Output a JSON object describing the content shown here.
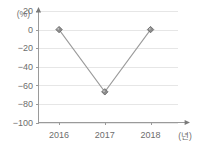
{
  "chart_data": {
    "type": "line",
    "title": "",
    "subtitle": "",
    "xlabel": "(년)",
    "ylabel": "(%)",
    "categories": [
      "2016",
      "2017",
      "2018"
    ],
    "x": [
      2016,
      2017,
      2018
    ],
    "values": [
      0,
      -67,
      0
    ],
    "series": [
      {
        "name": "",
        "values": [
          0,
          -67,
          0
        ]
      }
    ],
    "ylim": [
      -100,
      20
    ],
    "xlim": [
      2015.55,
      2018.6
    ],
    "y_ticks": [
      20,
      0,
      -20,
      -40,
      -60,
      -80,
      -100
    ],
    "y_tick_labels": [
      "20",
      "0",
      "−20",
      "−40",
      "−60",
      "−80",
      "−100"
    ],
    "x_ticks": [
      2016,
      2017,
      2018
    ],
    "x_tick_labels": [
      "2016",
      "2017",
      "2018"
    ],
    "grid": true,
    "grid_axis": "y",
    "legend": false,
    "legend_position": "none",
    "marker": "diamond",
    "annotations": []
  },
  "axes": {
    "y_caption": "(%)",
    "x_caption": "(년)"
  },
  "colors": {
    "background": "#ffffff",
    "gridline": "#e6e6e6",
    "axis": "#9a9a9a",
    "line": "#9b9b9b",
    "marker_fill": "#8c8c8c",
    "marker_edge": "#5f5f5f",
    "marker_highlight": "#c9c9c9",
    "text": "#6d6d6d"
  }
}
